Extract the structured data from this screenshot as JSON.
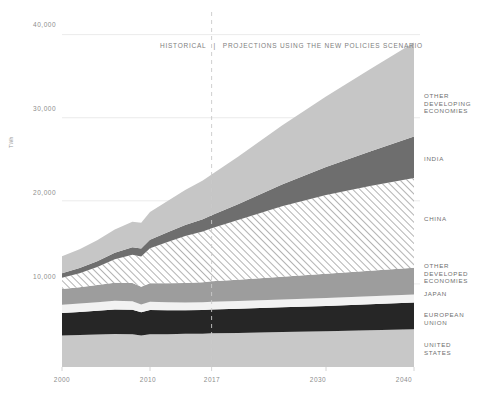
{
  "chart_data": {
    "type": "area",
    "stacked": true,
    "title": "",
    "banner": "HISTORICAL  |  PROJECTIONS USING THE NEW POLICIES SCENARIO",
    "banner_parts": {
      "left": "HISTORICAL",
      "divider": "|",
      "right": "PROJECTIONS USING THE NEW POLICIES SCENARIO"
    },
    "xlabel": "",
    "ylabel": "TWh",
    "xlim": [
      2000,
      2040
    ],
    "ylim": [
      0,
      42000
    ],
    "yticks": [
      10000,
      20000,
      30000,
      40000
    ],
    "ytick_labels": [
      "10,000",
      "20,000",
      "30,000",
      "40,000"
    ],
    "xticks": [
      2000,
      2010,
      2017,
      2030,
      2040
    ],
    "xtick_labels": [
      "2000",
      "2010",
      "2017",
      "2030",
      "2040"
    ],
    "grid": "horizontal-light",
    "legend_position": "right",
    "divider_year": 2017,
    "x": [
      2000,
      2002,
      2004,
      2006,
      2008,
      2009,
      2010,
      2012,
      2014,
      2016,
      2017,
      2020,
      2025,
      2030,
      2035,
      2040
    ],
    "series": [
      {
        "name": "UNITED STATES",
        "label": "UNITED\nSTATES",
        "color": "#c8c8c8",
        "pattern": "solid",
        "values": [
          3800,
          3850,
          3900,
          3980,
          3950,
          3780,
          3950,
          3950,
          4000,
          4000,
          4050,
          4100,
          4200,
          4300,
          4420,
          4550
        ]
      },
      {
        "name": "EUROPEAN UNION",
        "label": "EUROPEAN\nUNION",
        "color": "#262626",
        "pattern": "solid",
        "values": [
          2700,
          2780,
          2870,
          2950,
          2950,
          2800,
          2900,
          2880,
          2830,
          2850,
          2870,
          2900,
          2980,
          3050,
          3130,
          3200
        ]
      },
      {
        "name": "JAPAN",
        "label": "JAPAN",
        "color": "#f2f2f2",
        "pattern": "solid",
        "values": [
          980,
          1000,
          1020,
          1030,
          1020,
          950,
          1000,
          960,
          930,
          930,
          930,
          930,
          940,
          950,
          960,
          970
        ]
      },
      {
        "name": "OTHER DEVELOPED ECONOMIES",
        "label": "OTHER\nDEVELOPED\nECONOMIES",
        "color": "#9d9d9d",
        "pattern": "solid",
        "values": [
          1900,
          1980,
          2070,
          2170,
          2200,
          2130,
          2230,
          2300,
          2360,
          2420,
          2460,
          2560,
          2740,
          2910,
          3070,
          3220
        ]
      },
      {
        "name": "CHINA",
        "label": "CHINA",
        "color": "#ffffff",
        "pattern": "diagonal-hatch",
        "values": [
          1350,
          1680,
          2180,
          2830,
          3400,
          3640,
          4200,
          4950,
          5650,
          6100,
          6400,
          7200,
          8500,
          9500,
          10200,
          10800
        ]
      },
      {
        "name": "INDIA",
        "label": "INDIA",
        "color": "#6e6e6e",
        "pattern": "solid",
        "values": [
          560,
          620,
          700,
          800,
          900,
          950,
          1030,
          1180,
          1320,
          1480,
          1560,
          1900,
          2600,
          3350,
          4150,
          5000
        ]
      },
      {
        "name": "OTHER DEVELOPING ECONOMIES",
        "label": "OTHER\nDEVELOPING\nECONOMIES",
        "color": "#c6c6c6",
        "pattern": "solid",
        "values": [
          2050,
          2250,
          2500,
          2800,
          3050,
          3100,
          3350,
          3750,
          4200,
          4650,
          4900,
          5700,
          7100,
          8500,
          9900,
          11300
        ]
      }
    ],
    "totals_note": "stacked totals rise from about 13,300 TWh in 2000 to about 39,000 TWh in 2040"
  },
  "legend": [
    {
      "id": "other-developing-economies",
      "text": "OTHER\nDEVELOPING\nECONOMIES",
      "top": 92
    },
    {
      "id": "india",
      "text": "INDIA",
      "top": 155
    },
    {
      "id": "china",
      "text": "CHINA",
      "top": 215
    },
    {
      "id": "other-developed-economies",
      "text": "OTHER\nDEVELOPED\nECONOMIES",
      "top": 262
    },
    {
      "id": "japan",
      "text": "JAPAN",
      "top": 290
    },
    {
      "id": "european-union",
      "text": "EUROPEAN\nUNION",
      "top": 311
    },
    {
      "id": "united-states",
      "text": "UNITED\nSTATES",
      "top": 341
    }
  ],
  "axis": {
    "y_label": "TWh",
    "y_ticks": [
      {
        "value": "40,000",
        "top": 21
      },
      {
        "value": "30,000",
        "top": 105
      },
      {
        "value": "20,000",
        "top": 189
      },
      {
        "value": "10,000",
        "top": 273
      }
    ],
    "x_ticks": [
      {
        "value": "2000",
        "left": 42
      },
      {
        "value": "2010",
        "left": 128
      },
      {
        "value": "2017",
        "left": 192
      },
      {
        "value": "2030",
        "left": 298
      },
      {
        "value": "2040",
        "left": 384
      }
    ]
  },
  "banner": {
    "left": "HISTORICAL",
    "divider": "|",
    "right": "PROJECTIONS USING THE NEW POLICIES SCENARIO"
  },
  "colors": {
    "background": "#ffffff",
    "grid": "#e6e6e6",
    "text": "#8d8d8d",
    "divider_line": "#c9c9c9"
  }
}
